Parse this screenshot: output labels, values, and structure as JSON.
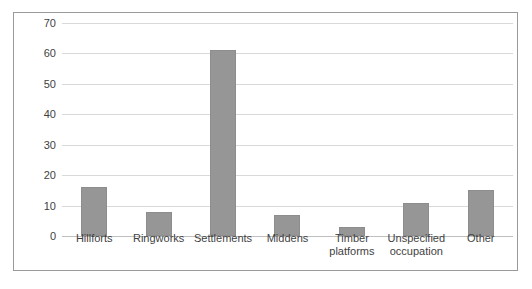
{
  "chart_data": {
    "type": "bar",
    "title": "",
    "subtitle": "",
    "xlabel": "",
    "ylabel": "",
    "ylim": [
      0,
      70
    ],
    "yticks": [
      0,
      10,
      20,
      30,
      40,
      50,
      60,
      70
    ],
    "ytick_labels": [
      "0",
      "10",
      "20",
      "30",
      "40",
      "50",
      "60",
      "70"
    ],
    "grid": true,
    "legend": false,
    "legend_position": "none",
    "categories": [
      "Hillforts",
      "Ringworks",
      "Settlements",
      "Middens",
      "Timber platforms",
      "Unspecified occupation",
      "Other"
    ],
    "category_lines": [
      [
        "Hillforts"
      ],
      [
        "Ringworks"
      ],
      [
        "Settlements"
      ],
      [
        "Middens"
      ],
      [
        "Timber",
        "platforms"
      ],
      [
        "Unspecified",
        "occupation"
      ],
      [
        "Other"
      ]
    ],
    "values": [
      16,
      8,
      61,
      7,
      3,
      11,
      15
    ],
    "series": [
      {
        "name": "Count",
        "values": [
          16,
          8,
          61,
          7,
          3,
          11,
          15
        ],
        "color": "#969696"
      }
    ],
    "bar_color": "#969696",
    "bar_border_color": "#8d8d8d",
    "gridline_color": "#d9d9d9",
    "axis_color": "#bfbfbf",
    "frame_color": "#9a9a9a",
    "text_color": "#3f3f3f"
  }
}
